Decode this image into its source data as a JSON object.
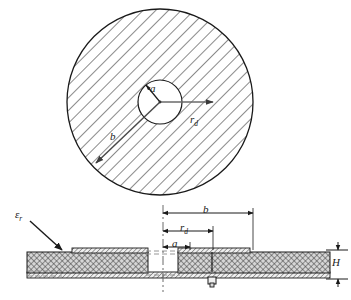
{
  "figure": {
    "type": "engineering-drawing",
    "views": [
      {
        "name": "top-view",
        "shape": "annulus",
        "description": "hatched circular patch with central circular aperture"
      },
      {
        "name": "cross-section-view",
        "description": "layered substrate with patch, ground plane and coaxial feed pin"
      }
    ]
  },
  "labels": {
    "outer_radius": "b",
    "inner_radius": "a",
    "feed_radius_base": "r",
    "feed_radius_sub": "d",
    "permittivity_base": "ε",
    "permittivity_sub": "r",
    "substrate_height": "H"
  },
  "top_view": {
    "center_x": 160,
    "center_y": 102,
    "outer_radius_px": 93,
    "inner_radius_px": 22,
    "hatch_angle_deg": 45,
    "hatch_spacing_px": 9,
    "arrows": [
      {
        "data_name": "radius-b-arrow",
        "label": "b",
        "from": "center",
        "direction": "down-left",
        "tip_x": 95,
        "tip_y": 163
      },
      {
        "data_name": "radius-a-arrow",
        "label": "a",
        "from": "center",
        "direction": "up-left",
        "tip_x": 146,
        "tip_y": 83
      },
      {
        "data_name": "radius-rd-arrow",
        "label": "r_d",
        "from": "center",
        "direction": "right",
        "tip_x": 214,
        "tip_y": 102
      }
    ]
  },
  "cross_section": {
    "centerline_x": 163,
    "substrate_top_y": 252,
    "substrate_bottom_y": 278,
    "left_edge_x": 27,
    "right_edge_x": 330,
    "gap_left_x": 148,
    "gap_right_x": 178,
    "feed_pin_x": 212,
    "dimensions": [
      {
        "data_name": "dimension-b",
        "label": "b",
        "y": 213,
        "from_x": 163,
        "to_x": 253
      },
      {
        "data_name": "dimension-rd",
        "label": "r_d",
        "y": 231,
        "from_x": 163,
        "to_x": 213
      },
      {
        "data_name": "dimension-a",
        "label": "a",
        "y": 247,
        "from_x": 163,
        "to_x": 190
      },
      {
        "data_name": "dimension-H",
        "label": "H",
        "x": 338,
        "from_y": 250,
        "to_y": 280
      }
    ],
    "callout": {
      "data_name": "permittivity-callout",
      "label": "εr",
      "text_x": 18,
      "text_y": 214,
      "tip_x": 62,
      "tip_y": 251
    }
  },
  "colors": {
    "line": "#1a1a1a",
    "hatch": "#333333",
    "fill_light": "#e8e8e8",
    "fill_mid": "#c9c9c9",
    "background": "#ffffff",
    "arrow_gray": "#555555"
  }
}
